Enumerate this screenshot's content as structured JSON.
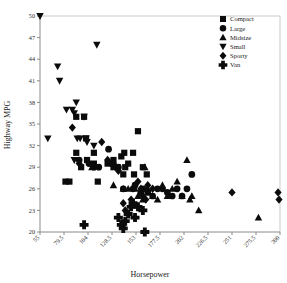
{
  "chart_data": {
    "type": "scatter",
    "title": "",
    "xlabel": "Horsepower",
    "ylabel": "Highway MPG",
    "xlim": [
      55,
      300
    ],
    "ylim": [
      20,
      50
    ],
    "xticks": [
      "55",
      "79.5",
      "104",
      "128.5",
      "153",
      "177.5",
      "202",
      "226.5",
      "251",
      "275.5",
      "300"
    ],
    "xtick_values": [
      55,
      79.5,
      104,
      128.5,
      153,
      177.5,
      202,
      226.5,
      251,
      275.5,
      300
    ],
    "yticks": [
      "50",
      "47",
      "44",
      "41",
      "38",
      "35",
      "32",
      "29",
      "26",
      "23",
      "20"
    ],
    "ytick_values": [
      50,
      47,
      44,
      41,
      38,
      35,
      32,
      29,
      26,
      23,
      20
    ],
    "grid": false,
    "legend_position": "top-right",
    "marker_color": "#0b0b0b",
    "series": [
      {
        "name": "Compact",
        "marker": "square",
        "points": [
          [
            92,
            36.0
          ],
          [
            92,
            31.0
          ],
          [
            100,
            36.0
          ],
          [
            102,
            33.0
          ],
          [
            103,
            30.0
          ],
          [
            110,
            31.0
          ],
          [
            110,
            29.5
          ],
          [
            114,
            27.0
          ],
          [
            124,
            29.5
          ],
          [
            130,
            30.0
          ],
          [
            130,
            29.0
          ],
          [
            134,
            29.0
          ],
          [
            138,
            30.5
          ],
          [
            140,
            28.0
          ],
          [
            141,
            31.0
          ],
          [
            142,
            29.0
          ],
          [
            145,
            29.5
          ],
          [
            150,
            31.0
          ],
          [
            151,
            28.0
          ],
          [
            155,
            34.0
          ],
          [
            160,
            29.0
          ],
          [
            164,
            28.0
          ],
          [
            81,
            27.0
          ],
          [
            85,
            27.0
          ],
          [
            97,
            29.0
          ]
        ]
      },
      {
        "name": "Large",
        "marker": "circle",
        "points": [
          [
            95,
            30.0
          ],
          [
            105,
            29.5
          ],
          [
            110,
            29.0
          ],
          [
            128,
            29.5
          ],
          [
            135,
            29.0
          ],
          [
            140,
            26.0
          ],
          [
            150,
            26.0
          ],
          [
            152,
            26.5
          ],
          [
            158,
            25.5
          ],
          [
            160,
            26.0
          ],
          [
            165,
            25.5
          ],
          [
            170,
            25.0
          ],
          [
            175,
            26.0
          ],
          [
            180,
            26.0
          ],
          [
            185,
            25.5
          ],
          [
            190,
            25.0
          ],
          [
            195,
            26.0
          ],
          [
            200,
            25.0
          ],
          [
            205,
            26.0
          ],
          [
            210,
            28.0
          ],
          [
            115,
            29.0
          ],
          [
            125,
            31.5
          ]
        ]
      },
      {
        "name": "Midsize",
        "marker": "triangle-up",
        "points": [
          [
            108,
            29.0
          ],
          [
            130,
            26.5
          ],
          [
            140,
            26.0
          ],
          [
            145,
            26.0
          ],
          [
            152,
            26.0
          ],
          [
            155,
            25.0
          ],
          [
            160,
            24.5
          ],
          [
            165,
            26.0
          ],
          [
            170,
            25.0
          ],
          [
            175,
            24.5
          ],
          [
            180,
            26.5
          ],
          [
            185,
            25.0
          ],
          [
            190,
            26.0
          ],
          [
            195,
            27.0
          ],
          [
            200,
            25.0
          ],
          [
            205,
            30.0
          ],
          [
            210,
            25.0
          ],
          [
            217,
            23.0
          ],
          [
            208,
            24.5
          ],
          [
            278,
            22.0
          ],
          [
            150,
            24.0
          ],
          [
            162,
            29.0
          ]
        ]
      },
      {
        "name": "Small",
        "marker": "triangle-down",
        "points": [
          [
            55,
            50.0
          ],
          [
            63,
            33.0
          ],
          [
            73,
            43.0
          ],
          [
            75,
            41.0
          ],
          [
            82,
            37.0
          ],
          [
            88,
            37.0
          ],
          [
            90,
            36.5
          ],
          [
            92,
            38.0
          ],
          [
            93,
            33.0
          ],
          [
            96,
            33.0
          ],
          [
            100,
            36.0
          ],
          [
            102,
            33.0
          ],
          [
            103,
            32.5
          ],
          [
            110,
            32.0
          ],
          [
            113,
            46.0
          ],
          [
            90,
            30.0
          ]
        ]
      },
      {
        "name": "Sporty",
        "marker": "diamond",
        "points": [
          [
            88,
            34.5
          ],
          [
            95,
            29.5
          ],
          [
            118,
            32.5
          ],
          [
            124,
            30.0
          ],
          [
            130,
            29.5
          ],
          [
            140,
            24.0
          ],
          [
            142,
            23.0
          ],
          [
            148,
            24.5
          ],
          [
            155,
            27.0
          ],
          [
            158,
            26.0
          ],
          [
            160,
            25.0
          ],
          [
            163,
            24.5
          ],
          [
            165,
            26.5
          ],
          [
            170,
            26.0
          ],
          [
            251,
            25.5
          ],
          [
            298,
            25.5
          ],
          [
            299,
            24.5
          ],
          [
            135,
            28.5
          ]
        ]
      },
      {
        "name": "Van",
        "marker": "plus",
        "points": [
          [
            100,
            21.0
          ],
          [
            135,
            22.0
          ],
          [
            138,
            21.0
          ],
          [
            140,
            20.5
          ],
          [
            142,
            21.5
          ],
          [
            145,
            22.5
          ],
          [
            148,
            23.5
          ],
          [
            150,
            24.0
          ],
          [
            155,
            23.5
          ],
          [
            160,
            23.0
          ],
          [
            162,
            20.0
          ],
          [
            152,
            22.0
          ]
        ]
      }
    ]
  },
  "legend": {
    "items": [
      {
        "label": "Compact",
        "marker": "square"
      },
      {
        "label": "Large",
        "marker": "circle"
      },
      {
        "label": "Midsize",
        "marker": "triangle-up"
      },
      {
        "label": "Small",
        "marker": "triangle-down"
      },
      {
        "label": "Sporty",
        "marker": "diamond"
      },
      {
        "label": "Van",
        "marker": "plus"
      }
    ]
  }
}
